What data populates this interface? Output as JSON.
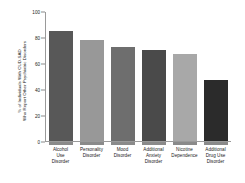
{
  "chart_data": {
    "type": "bar",
    "title": "",
    "xlabel": "",
    "ylabel_line1": "% of Individuals With CUD-SAD",
    "ylabel_line2": "Who Report Other Psychiatric Disorders",
    "ylim": [
      0,
      100
    ],
    "yticks": [
      0,
      20,
      40,
      60,
      80,
      100
    ],
    "ytick_labels": [
      "0",
      "20",
      "40",
      "60",
      "80",
      "100"
    ],
    "grid": false,
    "legend": "none",
    "categories": [
      "Alcohol Use Disorder",
      "Personality Disorder",
      "Mood Disorder",
      "Additional Anxiety Disorder",
      "Nicotine Dependence",
      "Additional Drug Use Disorder"
    ],
    "category_lines": [
      [
        "Alcohol",
        "Use",
        "Disorder"
      ],
      [
        "Personality",
        "Disorder"
      ],
      [
        "Mood",
        "Disorder"
      ],
      [
        "Additional",
        "Anxiety",
        "Disorder"
      ],
      [
        "Nicotine",
        "Dependence"
      ],
      [
        "Additional",
        "Drug Use",
        "Disorder"
      ]
    ],
    "values": [
      85,
      78,
      72,
      70,
      67,
      47
    ],
    "bar_colors": [
      "#585858",
      "#989898",
      "#6e6e6e",
      "#4a4a4a",
      "#a8a8a8",
      "#2b2b2b"
    ]
  }
}
